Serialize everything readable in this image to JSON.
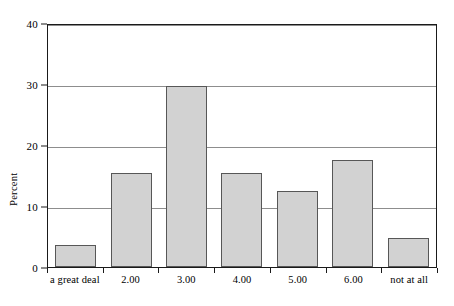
{
  "chart_data": {
    "type": "bar",
    "title": "",
    "subtitle": "",
    "xlabel": "",
    "ylabel": "Percent",
    "categories": [
      "a great deal",
      "2.00",
      "3.00",
      "4.00",
      "5.00",
      "6.00",
      "not at all"
    ],
    "values": [
      3.6,
      15.6,
      29.9,
      15.6,
      12.6,
      17.7,
      4.8
    ],
    "ylim": [
      0,
      40
    ],
    "xlim": [
      0,
      7
    ],
    "y_ticks": [
      "0",
      "10",
      "20",
      "30",
      "40"
    ],
    "y_tick_values": [
      0,
      10,
      20,
      30,
      40
    ],
    "gridlines": [
      10,
      20,
      30,
      40
    ],
    "grid": true,
    "legend": null,
    "legend_position": "none",
    "annotations": [],
    "colors": {
      "bar_fill": "#d2d2d2",
      "bar_border": "#575757",
      "axis": "#1a1a1a",
      "gridline": "#8d8d8d",
      "background": "#ffffff",
      "text": "#000000"
    }
  }
}
